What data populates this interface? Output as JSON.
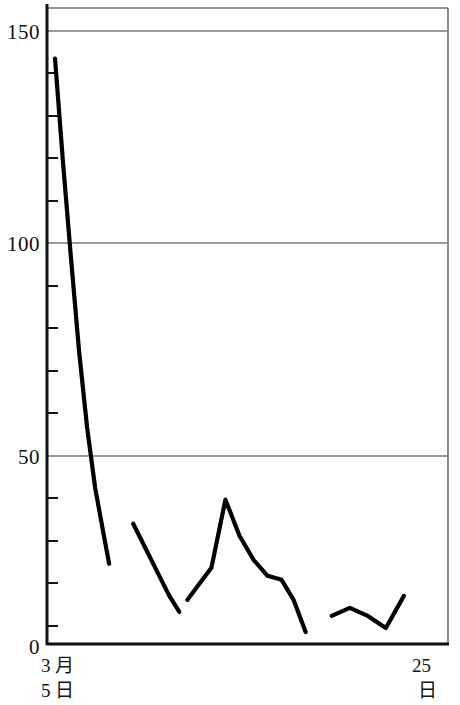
{
  "chart_data": {
    "type": "line",
    "title": "",
    "subtitle": "",
    "xlabel": "",
    "ylabel": "",
    "xlim": [
      5,
      25
    ],
    "ylim": [
      0,
      157
    ],
    "grid": true,
    "grid_axis": "y",
    "legend": "none",
    "y_ticks_major": [
      0,
      50,
      100,
      150
    ],
    "y_tick_labels": [
      "0",
      "50",
      "100",
      "150"
    ],
    "y_ticks_minor": [
      10,
      20,
      30,
      40,
      60,
      70,
      80,
      90,
      110,
      120,
      130,
      140
    ],
    "x_tick_labels": {
      "left": [
        "3 月",
        "5 日"
      ],
      "right": [
        "25",
        "日"
      ]
    },
    "x_axis_caption_left_line1": "3 月",
    "x_axis_caption_left_line2": "5 日",
    "x_axis_caption_right_line1": "25",
    "x_axis_caption_right_line2": "日",
    "series": [
      {
        "name": "segment-1",
        "x": [
          5.4,
          5.8,
          6.2,
          6.6,
          7.0,
          7.4,
          7.8,
          8.1
        ],
        "values": [
          146,
          120,
          96,
          73,
          54,
          39,
          28,
          20
        ]
      },
      {
        "name": "segment-2",
        "x": [
          9.3,
          9.9,
          10.5,
          11.1,
          11.6
        ],
        "values": [
          30,
          24,
          18,
          12,
          8
        ]
      },
      {
        "name": "segment-3",
        "x": [
          12.0,
          12.6,
          13.2,
          13.9,
          14.6,
          15.3,
          16.0,
          16.7,
          17.3,
          17.9
        ],
        "values": [
          11,
          15,
          19,
          36,
          27,
          21,
          17,
          16,
          11,
          3
        ]
      },
      {
        "name": "segment-4",
        "x": [
          19.2,
          20.1,
          21.0,
          21.9,
          22.8
        ],
        "values": [
          7,
          9,
          7,
          4,
          12
        ]
      }
    ],
    "line_color": "#000000",
    "grid_color": "#7a7a7a",
    "axis_color": "#111111",
    "background_color": "#ffffff"
  },
  "axis": {
    "y_labels": [
      "150",
      "100",
      "50",
      "0"
    ]
  },
  "xcaption": {
    "left_month": "3 月",
    "left_day": "5 日",
    "right_day_num": "25",
    "right_day_unit": "日"
  }
}
